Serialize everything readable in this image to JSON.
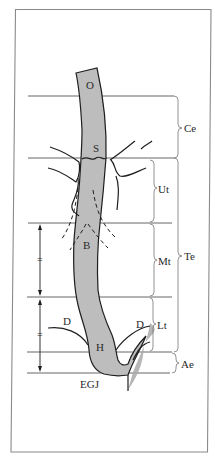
{
  "figure": {
    "landmarks": {
      "O": "O",
      "S": "S",
      "B": "B",
      "H": "H",
      "D_left": "D",
      "D_right": "D",
      "EGJ": "EGJ"
    },
    "regions": {
      "Ce": "Ce",
      "Ut": "Ut",
      "Mt": "Mt",
      "Lt": "Lt",
      "Ae": "Ae",
      "Te": "Te"
    },
    "equal_marks": [
      "=",
      "="
    ],
    "colors": {
      "tube_fill": "#bdbdbd",
      "stomach_fill": "#a9a9a9",
      "line": "#1e1e1e",
      "frame": "#8a8a8a"
    }
  }
}
